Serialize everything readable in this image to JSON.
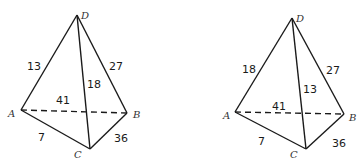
{
  "figures": [
    {
      "vertices": {
        "A": "A",
        "B": "B",
        "C": "C",
        "D": "D"
      },
      "edges": {
        "AD": "13",
        "BD": "27",
        "CD": "18",
        "AB": "41",
        "AC": "7",
        "BC": "36"
      }
    },
    {
      "vertices": {
        "A": "A",
        "B": "B",
        "C": "C",
        "D": "D"
      },
      "edges": {
        "AD": "18",
        "BD": "27",
        "CD": "13",
        "AB": "41",
        "AC": "7",
        "BC": "36"
      }
    }
  ]
}
